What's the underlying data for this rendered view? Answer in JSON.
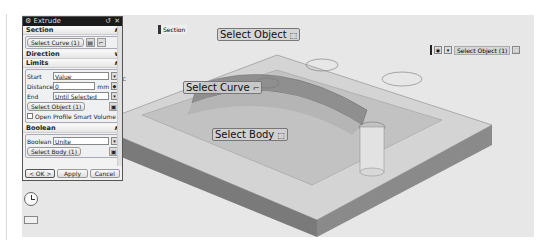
{
  "dialog": {
    "title": "Extrude",
    "title_controls": [
      "reset-icon",
      "close-icon"
    ],
    "section": {
      "header": "Section",
      "select_curve_label": "Select Curve (1)"
    },
    "direction": {
      "header": "Direction"
    },
    "limits": {
      "header": "Limits",
      "start_label": "Start",
      "start_value": "Value",
      "distance_label": "Distance",
      "distance_value": "0",
      "distance_unit": "mm",
      "end_label": "End",
      "end_value": "Until Selected",
      "select_object_label": "Select Object (1)",
      "open_profile_label": "Open Profile Smart Volume"
    },
    "boolean": {
      "header": "Boolean",
      "boolean_label": "Boolean",
      "boolean_value": "Unite",
      "select_body_label": "Select Body (1)"
    },
    "footer": {
      "ok_label": "< OK >",
      "apply_label": "Apply",
      "cancel_label": "Cancel"
    }
  },
  "viewport": {
    "section_tag": "Section",
    "labels": {
      "select_object": "Select Object",
      "select_curve": "Select Curve",
      "select_body": "Select Body"
    },
    "object_toolbar": {
      "label": "Select Object (1)"
    },
    "axis_label": "ZC"
  },
  "colors": {
    "viewport_bg": "#e7e7e7",
    "top_face": "#d2d2d2",
    "side_face": "#7e7e7e",
    "title_bar": "#1a1a1a"
  }
}
